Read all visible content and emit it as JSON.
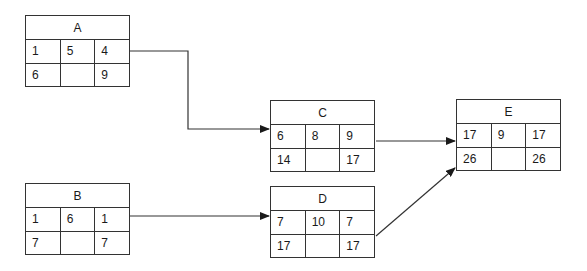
{
  "diagram": {
    "type": "activity-on-node network",
    "nodes": {
      "A": {
        "label": "A",
        "top": [
          "1",
          "5",
          "4"
        ],
        "bottom": [
          "6",
          "",
          "9"
        ]
      },
      "B": {
        "label": "B",
        "top": [
          "1",
          "6",
          "1"
        ],
        "bottom": [
          "7",
          "",
          "7"
        ]
      },
      "C": {
        "label": "C",
        "top": [
          "6",
          "8",
          "9"
        ],
        "bottom": [
          "14",
          "",
          "17"
        ]
      },
      "D": {
        "label": "D",
        "top": [
          "7",
          "10",
          "7"
        ],
        "bottom": [
          "17",
          "",
          "17"
        ]
      },
      "E": {
        "label": "E",
        "top": [
          "17",
          "9",
          "17"
        ],
        "bottom": [
          "26",
          "",
          "26"
        ]
      }
    },
    "edges": [
      {
        "from": "A",
        "to": "C"
      },
      {
        "from": "B",
        "to": "D"
      },
      {
        "from": "C",
        "to": "E"
      },
      {
        "from": "D",
        "to": "E"
      }
    ],
    "colors": {
      "line": "#333333",
      "background": "#ffffff"
    }
  }
}
